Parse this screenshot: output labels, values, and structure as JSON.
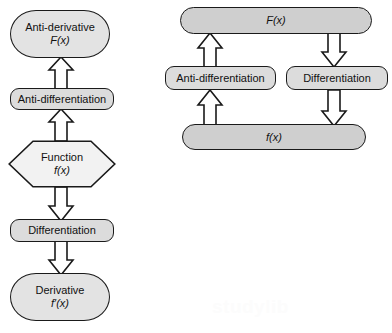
{
  "canvas": {
    "width": 392,
    "height": 333,
    "background": "#ffffff"
  },
  "palette": {
    "outline": "#1a1a1a",
    "terminal_fill": "#e3e3e3",
    "process_fill": "#dcdcdc",
    "pill_fill": "#cfcfcf",
    "hexagon_fill": "#f2f2f2",
    "arrow_fill": "#ffffff",
    "text": "#111111",
    "watermark": "#fcfcfc"
  },
  "left_flowchart": {
    "name": "vertical-calculus-flowchart",
    "nodes": [
      {
        "id": "antiderivative",
        "shape": "terminal",
        "line1": "Anti-derivative",
        "line2": "F(x)",
        "line2_italic": true
      },
      {
        "id": "antidifferentiation",
        "shape": "process",
        "line1": "Anti-differentiation",
        "line2": "",
        "line2_italic": false
      },
      {
        "id": "function",
        "shape": "hexagon",
        "line1": "Function",
        "line2": "f(x)",
        "line2_italic": true
      },
      {
        "id": "differentiation",
        "shape": "process",
        "line1": "Differentiation",
        "line2": "",
        "line2_italic": false
      },
      {
        "id": "derivative",
        "shape": "terminal",
        "line1": "Derivative",
        "line2": "f′(x)",
        "line2_italic": true
      }
    ],
    "arrows": [
      {
        "id": "antidiff-to-antiderivative",
        "direction": "up",
        "from": "antidifferentiation",
        "to": "antiderivative"
      },
      {
        "id": "function-to-antidiff",
        "direction": "up",
        "from": "function",
        "to": "antidifferentiation"
      },
      {
        "id": "function-to-diff",
        "direction": "down",
        "from": "function",
        "to": "differentiation"
      },
      {
        "id": "diff-to-derivative",
        "direction": "down",
        "from": "differentiation",
        "to": "derivative"
      }
    ]
  },
  "right_cycle": {
    "name": "calculus-cycle-diagram",
    "nodes": [
      {
        "id": "Fx",
        "shape": "pill",
        "label": "F(x)",
        "italic": true
      },
      {
        "id": "anti-differentiation",
        "shape": "process",
        "label": "Anti-differentiation",
        "italic": false
      },
      {
        "id": "differentiation",
        "shape": "process",
        "label": "Differentiation",
        "italic": false
      },
      {
        "id": "fx",
        "shape": "pill",
        "label": "f(x)",
        "italic": true
      }
    ],
    "arrows": [
      {
        "id": "antidiff-up-to-Fx",
        "direction": "up",
        "from": "anti-differentiation",
        "to": "Fx"
      },
      {
        "id": "fx-up-to-antidiff",
        "direction": "up",
        "from": "fx",
        "to": "anti-differentiation"
      },
      {
        "id": "Fx-down-to-diff",
        "direction": "down",
        "from": "Fx",
        "to": "differentiation"
      },
      {
        "id": "diff-down-to-fx",
        "direction": "down",
        "from": "differentiation",
        "to": "fx"
      }
    ]
  },
  "watermark": {
    "text": "studylib"
  }
}
